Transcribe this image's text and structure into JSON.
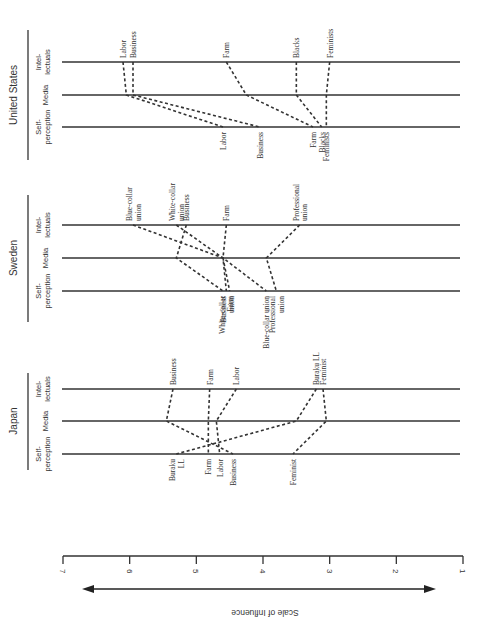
{
  "scale": {
    "label": "Scale of Influence",
    "min": 1,
    "max": 7,
    "ticks": [
      "7",
      "6",
      "5",
      "4",
      "3",
      "2",
      "1"
    ],
    "direction": "high influence on left (7) to low on right (1)"
  },
  "row_labels": {
    "intellectuals": [
      "Intel-",
      "lectuals"
    ],
    "media": [
      "Media"
    ],
    "self": [
      "Self-",
      "perception"
    ]
  },
  "panels": [
    {
      "country": "United States",
      "groups": [
        {
          "name": "Labor",
          "top_label": [
            "Labor"
          ],
          "bottom_label": [
            "Labor"
          ],
          "intellectuals": 6.1,
          "media": 6.05,
          "self": 4.6
        },
        {
          "name": "Business",
          "top_label": [
            "Business"
          ],
          "bottom_label": [
            "Business"
          ],
          "intellectuals": 5.95,
          "media": 5.95,
          "self": 4.05
        },
        {
          "name": "Farm",
          "top_label": [
            "Farm"
          ],
          "bottom_label": [
            "Farm"
          ],
          "intellectuals": 4.55,
          "media": 4.25,
          "self": 3.25
        },
        {
          "name": "Blacks",
          "top_label": [
            "Blacks"
          ],
          "bottom_label": [
            "Blacks"
          ],
          "intellectuals": 3.5,
          "media": 3.5,
          "self": 3.12
        },
        {
          "name": "Feminists",
          "top_label": [
            "Feminists"
          ],
          "bottom_label": [
            "Feminists"
          ],
          "intellectuals": 3.0,
          "media": 3.05,
          "self": 3.05
        }
      ]
    },
    {
      "country": "Sweden",
      "groups": [
        {
          "name": "Blue-collar union",
          "top_label": [
            "Blue-collar",
            "union"
          ],
          "bottom_label": [
            "Blue-collar union"
          ],
          "intellectuals": 5.95,
          "media": 4.6,
          "self": 3.95
        },
        {
          "name": "White-collar union",
          "top_label": [
            "White-collar",
            "union"
          ],
          "bottom_label": [
            "White-collar",
            "union"
          ],
          "intellectuals": 5.3,
          "media": 4.6,
          "self": 4.55
        },
        {
          "name": "Business",
          "top_label": [
            "Business"
          ],
          "bottom_label": [
            "Business"
          ],
          "intellectuals": 5.15,
          "media": 5.3,
          "self": 4.6
        },
        {
          "name": "Farm",
          "top_label": [
            "Farm"
          ],
          "bottom_label": [
            "Farm"
          ],
          "intellectuals": 4.55,
          "media": 4.6,
          "self": 4.5
        },
        {
          "name": "Professional union",
          "top_label": [
            "Professional",
            "union"
          ],
          "bottom_label": [
            "Professional",
            "union"
          ],
          "intellectuals": 3.45,
          "media": 3.95,
          "self": 3.8
        }
      ]
    },
    {
      "country": "Japan",
      "groups": [
        {
          "name": "Business",
          "top_label": [
            "Business"
          ],
          "bottom_label": [
            "Business"
          ],
          "intellectuals": 5.35,
          "media": 5.45,
          "self": 4.45
        },
        {
          "name": "Farm",
          "top_label": [
            "Farm"
          ],
          "bottom_label": [
            "Farm"
          ],
          "intellectuals": 4.8,
          "media": 4.82,
          "self": 4.82
        },
        {
          "name": "Labor",
          "top_label": [
            "Labor"
          ],
          "bottom_label": [
            "Labor"
          ],
          "intellectuals": 4.4,
          "media": 4.7,
          "self": 4.65
        },
        {
          "name": "Buraku LL",
          "top_label": [
            "Buraku LL"
          ],
          "bottom_label": [
            "Buraku",
            "LL"
          ],
          "intellectuals": 3.2,
          "media": 3.5,
          "self": 5.3
        },
        {
          "name": "Feminist",
          "top_label": [
            "Feminist"
          ],
          "bottom_label": [
            "Feminist"
          ],
          "intellectuals": 3.1,
          "media": 3.05,
          "self": 3.55
        }
      ]
    }
  ]
}
